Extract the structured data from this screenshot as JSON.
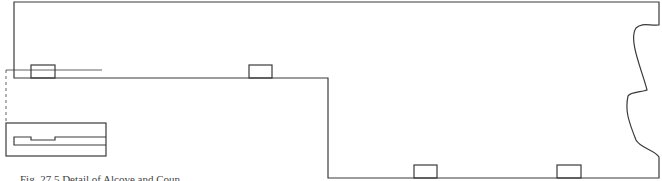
{
  "figure": {
    "caption": "Fig. 27.5 Detail of Alcove and Coun",
    "stroke_color": "#3a3a3a",
    "background": "#ffffff"
  }
}
